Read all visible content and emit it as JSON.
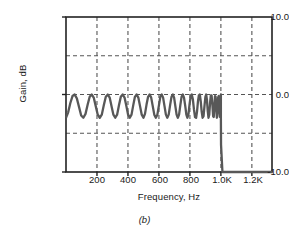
{
  "figure": {
    "caption": "(b)",
    "line_color": "#585858",
    "axis_color": "#222222",
    "grid_color": "#555555",
    "background": "#ffffff"
  },
  "chart_data": {
    "type": "line",
    "title": "",
    "subtitle": "",
    "caption": "(b)",
    "xlabel": "Frequency, Hz",
    "ylabel": "Gain, dB",
    "xlim": [
      0,
      1330
    ],
    "ylim": [
      -10.0,
      10.0
    ],
    "grid": true,
    "grid_x_values": [
      200,
      400,
      600,
      800,
      1000,
      1200
    ],
    "grid_y_values": [
      5.0,
      0.0,
      -5.0
    ],
    "legend": null,
    "legend_position": "none",
    "xticks": [
      200,
      400,
      600,
      800,
      1000,
      1200
    ],
    "xtick_labels": [
      "200",
      "400",
      "600",
      "800",
      "1.0K",
      "1.2K"
    ],
    "yticks": [
      10.0,
      0.0,
      -10.0
    ],
    "ytick_labels": [
      "10.0",
      "0.0",
      "-10.0"
    ],
    "series": [
      {
        "name": "Chebyshev passband response",
        "ripple_db": 3.0,
        "passband_max_db": 0.0,
        "passband_min_db": -3.0,
        "cutoff_hz": 1000,
        "stopband_db": -10.0,
        "x": [
          0,
          14,
          28,
          42,
          56,
          70,
          84,
          98,
          112,
          126,
          140,
          153,
          166,
          179,
          192,
          205,
          218,
          231,
          244,
          257,
          270,
          282,
          294,
          306,
          318,
          330,
          342,
          354,
          366,
          378,
          390,
          401,
          412,
          423,
          434,
          445,
          456,
          467,
          478,
          489,
          500,
          510,
          520,
          530,
          540,
          550,
          560,
          570,
          580,
          590,
          600,
          609,
          618,
          627,
          636,
          645,
          654,
          663,
          672,
          681,
          690,
          698,
          706,
          714,
          722,
          730,
          738,
          746,
          754,
          762,
          770,
          777,
          784,
          791,
          798,
          805,
          812,
          819,
          826,
          833,
          840,
          846,
          852,
          858,
          864,
          870,
          876,
          882,
          888,
          894,
          900,
          905,
          910,
          915,
          920,
          925,
          930,
          935,
          940,
          945,
          950,
          954,
          958,
          962,
          966,
          970,
          974,
          978,
          982,
          986,
          990,
          993,
          996,
          999,
          1000,
          1000,
          1001,
          1010,
          1060,
          1150,
          1260,
          1330
        ],
        "y": [
          -3.0,
          -2.3,
          -1.1,
          -0.2,
          0.0,
          -0.5,
          -1.6,
          -2.7,
          -3.0,
          -2.5,
          -1.3,
          -0.3,
          0.0,
          -0.4,
          -1.5,
          -2.6,
          -3.0,
          -2.6,
          -1.4,
          -0.3,
          0.0,
          -0.4,
          -1.5,
          -2.6,
          -3.0,
          -2.6,
          -1.4,
          -0.3,
          0.0,
          -0.4,
          -1.5,
          -2.6,
          -3.0,
          -2.6,
          -1.4,
          -0.3,
          0.0,
          -0.4,
          -1.5,
          -2.6,
          -3.0,
          -2.5,
          -1.3,
          -0.3,
          0.0,
          -0.4,
          -1.5,
          -2.6,
          -3.0,
          -2.6,
          -1.4,
          -0.3,
          0.0,
          -0.4,
          -1.5,
          -2.6,
          -3.0,
          -2.6,
          -1.4,
          -0.3,
          0.0,
          -0.4,
          -1.5,
          -2.6,
          -3.0,
          -2.6,
          -1.4,
          -0.3,
          0.0,
          -0.4,
          -1.5,
          -2.6,
          -3.0,
          -2.5,
          -1.2,
          -0.2,
          0.0,
          -0.6,
          -1.9,
          -2.9,
          -3.0,
          -2.2,
          -0.9,
          -0.1,
          0.0,
          -0.9,
          -2.2,
          -3.0,
          -2.8,
          -1.5,
          -0.3,
          0.0,
          -0.7,
          -2.1,
          -3.0,
          -2.6,
          -1.1,
          -0.1,
          -0.1,
          -1.3,
          -2.8,
          -2.9,
          -1.4,
          -0.2,
          -0.3,
          -1.9,
          -3.0,
          -2.2,
          -0.4,
          -0.2,
          -1.8,
          -2.9,
          -1.6,
          -0.3,
          0.0,
          -3.0,
          -6.5,
          -10.0,
          -10.0,
          -10.0,
          -10.0,
          -10.0
        ]
      }
    ]
  },
  "axes": {
    "ylabel": "Gain, dB",
    "xlabel": "Frequency, Hz",
    "ytick_top": "10.0",
    "ytick_mid": "0.0",
    "ytick_bottom": "-10.0",
    "xtick_1": "200",
    "xtick_2": "400",
    "xtick_3": "600",
    "xtick_4": "800",
    "xtick_5": "1.0K",
    "xtick_6": "1.2K"
  }
}
